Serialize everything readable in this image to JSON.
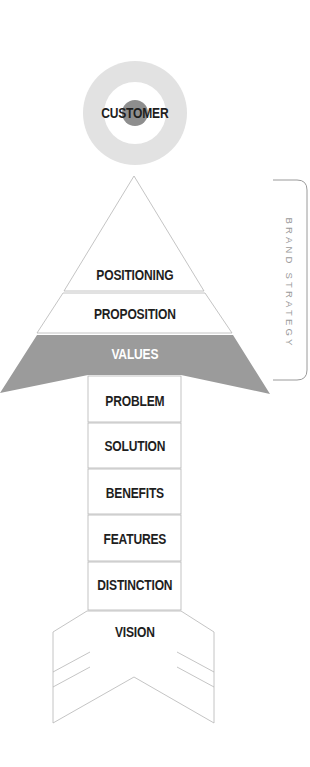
{
  "diagram": {
    "target": {
      "label": "CUSTOMER",
      "ring_color": "#e2e2e2",
      "center_color": "#8e8e8e"
    },
    "pyramid": {
      "layers": [
        {
          "label": "POSITIONING"
        },
        {
          "label": "PROPOSITION"
        },
        {
          "label": "VALUES",
          "fill": "#9b9b9b"
        }
      ]
    },
    "stem": {
      "rows": [
        {
          "label": "PROBLEM"
        },
        {
          "label": "SOLUTION"
        },
        {
          "label": "BENEFITS"
        },
        {
          "label": "FEATURES"
        },
        {
          "label": "DISTINCTION"
        }
      ]
    },
    "tail": {
      "label": "VISION"
    },
    "bracket": {
      "label": "BRAND STRATEGY"
    },
    "colors": {
      "line": "#b5b5b5",
      "text": "#1e1e1e",
      "values_fill": "#9b9b9b"
    }
  }
}
